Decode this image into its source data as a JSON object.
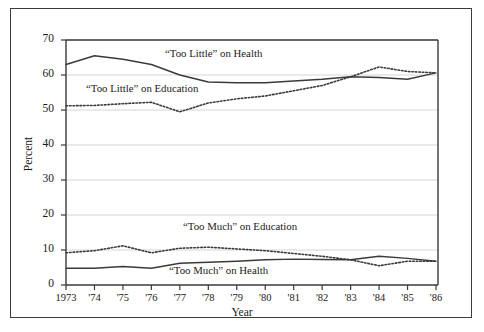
{
  "chart_data": {
    "type": "line",
    "title": "",
    "xlabel": "Year",
    "ylabel": "Percent",
    "ylim": [
      0,
      70
    ],
    "ytick_values": [
      0,
      10,
      20,
      30,
      40,
      50,
      60,
      70
    ],
    "grid": "horizontal",
    "legend_position": "inline-annotations",
    "x": [
      1973,
      1974,
      1975,
      1976,
      1977,
      1978,
      1979,
      1980,
      1981,
      1982,
      1983,
      1984,
      1985,
      1986
    ],
    "xtick_labels": [
      "1973",
      "'74",
      "'75",
      "'76",
      "'77",
      "'78",
      "'79",
      "'80",
      "'81",
      "'82",
      "'83",
      "'84",
      "'85",
      "'86"
    ],
    "series": [
      {
        "name": "“Too Little” on Health",
        "style": "solid",
        "color": "#3a3a3a",
        "values": [
          63.0,
          65.5,
          64.5,
          63.0,
          60.0,
          58.0,
          57.8,
          57.8,
          58.3,
          58.8,
          59.5,
          59.3,
          58.8,
          60.6
        ]
      },
      {
        "name": "“Too Little” on Education",
        "style": "dotted",
        "color": "#3a3a3a",
        "values": [
          51.2,
          51.3,
          51.8,
          52.2,
          49.5,
          52.0,
          53.2,
          54.0,
          55.5,
          57.0,
          59.5,
          62.3,
          61.0,
          60.6
        ]
      },
      {
        "name": "“Too Much” on Education",
        "style": "dotted",
        "color": "#3a3a3a",
        "values": [
          9.2,
          9.8,
          11.2,
          9.2,
          10.5,
          10.8,
          10.3,
          9.8,
          9.0,
          8.2,
          7.2,
          5.5,
          6.8,
          6.8
        ]
      },
      {
        "name": "“Too Much” on Health",
        "style": "solid",
        "color": "#3a3a3a",
        "values": [
          4.8,
          4.8,
          5.3,
          4.8,
          6.2,
          6.5,
          6.8,
          7.2,
          7.4,
          7.3,
          7.2,
          8.2,
          7.6,
          6.8
        ]
      }
    ],
    "annotations": [
      {
        "text": "“Too Little” on Health",
        "x_px": 165,
        "y_px": 47
      },
      {
        "text": "“Too Little” on Education",
        "x_px": 86,
        "y_px": 82
      },
      {
        "text": "“Too Much” on Education",
        "x_px": 183,
        "y_px": 220
      },
      {
        "text": "“Too Much” on Health",
        "x_px": 169,
        "y_px": 264
      }
    ]
  },
  "axis": {
    "y_title": "Percent",
    "x_title": "Year",
    "y_ticks": [
      "70",
      "60",
      "50",
      "40",
      "30",
      "20",
      "10",
      "0"
    ],
    "x_ticks": [
      "1973",
      "'74",
      "'75",
      "'76",
      "'77",
      "'78",
      "'79",
      "'80",
      "'81",
      "'82",
      "'83",
      "'84",
      "'85",
      "'86"
    ]
  },
  "colors": {
    "frame": "#3c3c3c",
    "axis": "#3a3a3a",
    "grid": "#d0d0d0",
    "series": "#3a3a3a",
    "background": "#ffffff"
  }
}
